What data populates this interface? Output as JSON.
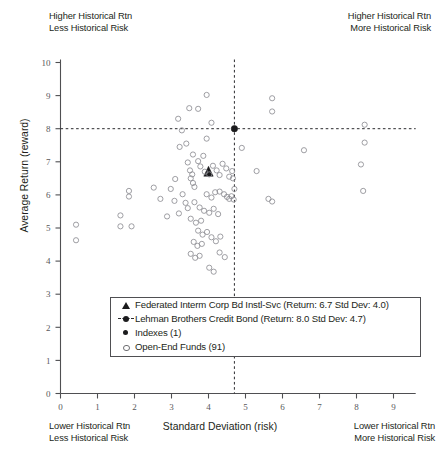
{
  "title": "",
  "annotations": {
    "top_left": [
      "Higher Historical Rtn",
      "Less Historical Risk"
    ],
    "top_right": [
      "Higher Historical Rtn",
      "More Historical Risk"
    ],
    "bottom_left": [
      "Lower Historical Rtn",
      "Less Historical Risk"
    ],
    "bottom_right": [
      "Lower Historical Rtn",
      "More Historical Risk"
    ]
  },
  "legend": {
    "items": [
      {
        "symbol": "triangle",
        "label": "Federated Interm Corp Bd Instl-Svc (Return: 6.7 Std Dev: 4.0)"
      },
      {
        "symbol": "dot-with-crosshair",
        "label": "Lehman Brothers Credit Bond (Return: 8.0 Std Dev: 4.7)"
      },
      {
        "symbol": "filled-dot",
        "label": "Indexes (1)"
      },
      {
        "symbol": "open-circle",
        "label": "Open-End Funds (91)"
      }
    ]
  },
  "chart_data": {
    "type": "scatter",
    "title": "",
    "xlabel": "Standard Deviation (risk)",
    "ylabel": "Average Return (reward)",
    "xlim": [
      0,
      9.6
    ],
    "ylim": [
      0,
      10
    ],
    "xticks": [
      0,
      1,
      2,
      3,
      4,
      5,
      6,
      7,
      8,
      9
    ],
    "yticks": [
      0,
      1,
      2,
      3,
      4,
      5,
      6,
      7,
      8,
      9,
      10
    ],
    "grid": false,
    "legend_position": "inside-bottom-center",
    "reference_lines": {
      "vertical_x": 4.7,
      "horizontal_y": 8.0,
      "style": "dashed",
      "color": "#2b2b2e"
    },
    "series": [
      {
        "name": "Federated Interm Corp Bd Instl-Svc",
        "marker": "triangle",
        "color": "#1b1b1d",
        "points": [
          [
            4.0,
            6.7
          ]
        ]
      },
      {
        "name": "Lehman Brothers Credit Bond",
        "marker": "filled-dot",
        "color": "#1b1b1d",
        "points": [
          [
            4.7,
            8.0
          ]
        ]
      },
      {
        "name": "Open-End Funds",
        "marker": "open-circle",
        "color": "#8e8e93",
        "count": 91,
        "points": [
          [
            0.42,
            5.1
          ],
          [
            0.42,
            4.63
          ],
          [
            1.85,
            6.12
          ],
          [
            1.85,
            5.95
          ],
          [
            1.62,
            5.38
          ],
          [
            1.62,
            5.05
          ],
          [
            1.92,
            5.05
          ],
          [
            2.52,
            6.22
          ],
          [
            2.7,
            5.88
          ],
          [
            3.18,
            8.3
          ],
          [
            3.28,
            7.95
          ],
          [
            3.22,
            7.45
          ],
          [
            3.95,
            7.7
          ],
          [
            4.08,
            8.18
          ],
          [
            3.48,
            8.62
          ],
          [
            3.72,
            8.6
          ],
          [
            3.95,
            9.02
          ],
          [
            3.58,
            7.22
          ],
          [
            3.72,
            7.02
          ],
          [
            3.86,
            7.18
          ],
          [
            3.44,
            6.98
          ],
          [
            3.5,
            6.74
          ],
          [
            3.56,
            6.62
          ],
          [
            3.52,
            6.5
          ],
          [
            3.58,
            6.36
          ],
          [
            3.62,
            6.24
          ],
          [
            3.78,
            6.86
          ],
          [
            3.9,
            6.7
          ],
          [
            4.02,
            6.62
          ],
          [
            4.12,
            6.88
          ],
          [
            4.22,
            6.74
          ],
          [
            4.3,
            6.6
          ],
          [
            4.38,
            6.94
          ],
          [
            4.48,
            6.8
          ],
          [
            4.56,
            6.55
          ],
          [
            4.64,
            6.72
          ],
          [
            4.66,
            6.5
          ],
          [
            4.7,
            6.18
          ],
          [
            4.3,
            6.1
          ],
          [
            4.42,
            6.02
          ],
          [
            4.5,
            5.94
          ],
          [
            4.56,
            5.88
          ],
          [
            4.62,
            5.96
          ],
          [
            4.68,
            5.86
          ],
          [
            3.95,
            6.02
          ],
          [
            4.08,
            5.92
          ],
          [
            4.18,
            6.08
          ],
          [
            3.3,
            6.02
          ],
          [
            3.38,
            5.76
          ],
          [
            3.44,
            5.6
          ],
          [
            3.62,
            5.78
          ],
          [
            3.76,
            5.62
          ],
          [
            3.88,
            5.52
          ],
          [
            4.02,
            5.46
          ],
          [
            4.14,
            5.58
          ],
          [
            4.26,
            5.42
          ],
          [
            3.52,
            5.28
          ],
          [
            3.66,
            5.16
          ],
          [
            3.8,
            5.22
          ],
          [
            3.2,
            5.44
          ],
          [
            3.08,
            5.82
          ],
          [
            2.98,
            6.18
          ],
          [
            3.72,
            4.92
          ],
          [
            3.84,
            4.8
          ],
          [
            3.96,
            4.88
          ],
          [
            4.08,
            4.72
          ],
          [
            4.2,
            4.6
          ],
          [
            4.32,
            4.74
          ],
          [
            3.6,
            4.58
          ],
          [
            3.7,
            4.46
          ],
          [
            3.82,
            4.52
          ],
          [
            3.52,
            4.22
          ],
          [
            3.64,
            4.1
          ],
          [
            3.76,
            4.16
          ],
          [
            4.3,
            4.26
          ],
          [
            4.44,
            4.12
          ],
          [
            4.02,
            3.8
          ],
          [
            4.14,
            3.68
          ],
          [
            3.4,
            7.55
          ],
          [
            3.1,
            6.48
          ],
          [
            2.88,
            5.35
          ],
          [
            4.9,
            7.42
          ],
          [
            5.3,
            6.72
          ],
          [
            5.72,
            8.92
          ],
          [
            5.72,
            8.52
          ],
          [
            5.62,
            5.88
          ],
          [
            5.72,
            5.8
          ],
          [
            6.58,
            7.35
          ],
          [
            8.22,
            8.12
          ],
          [
            8.22,
            7.58
          ],
          [
            8.12,
            6.92
          ],
          [
            8.18,
            6.12
          ]
        ]
      }
    ]
  }
}
